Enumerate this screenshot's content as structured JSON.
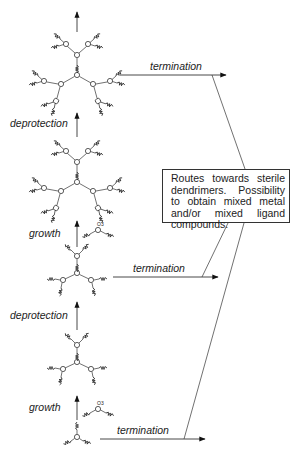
{
  "diagram": {
    "type": "dendrimer-synthesis-scheme",
    "labels": {
      "termination_1": "termination",
      "termination_2": "termination",
      "termination_3": "termination",
      "deprotection_1": "deprotection",
      "deprotection_2": "deprotection",
      "growth_1": "growth",
      "growth_2": "growth"
    },
    "reagent_label": "O3",
    "note_box": {
      "lines": [
        "Routes towards sterile",
        "dendrimers. Possibility",
        "to obtain mixed metal",
        "and/or mixed ligand",
        "compounds."
      ]
    },
    "structures": [
      "core",
      "generation-1-protected",
      "generation-1-deprotected",
      "generation-2-protected",
      "generation-2-deprotected"
    ],
    "colors": {
      "line": "#333333",
      "background": "#ffffff"
    }
  }
}
